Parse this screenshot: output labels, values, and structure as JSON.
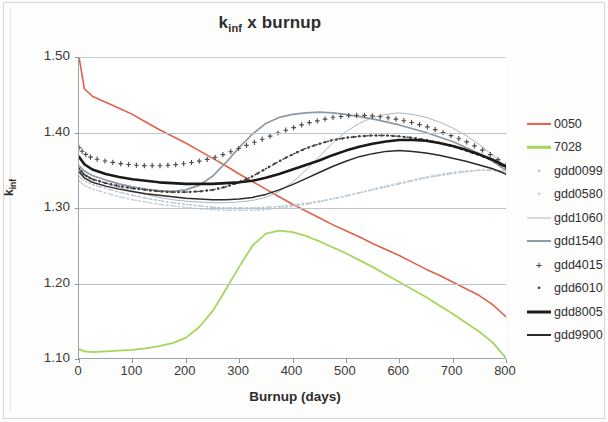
{
  "chart_data": {
    "type": "line",
    "title_main": "k",
    "title_sub": "inf",
    "title_rest": " x burnup",
    "xlabel": "Burnup (days)",
    "ylabel": "k_inf",
    "ylabel_main": "k",
    "ylabel_sub": "inf",
    "xlim": [
      0,
      800
    ],
    "ylim": [
      1.1,
      1.5
    ],
    "xticks": [
      0,
      100,
      200,
      300,
      400,
      500,
      600,
      700,
      800
    ],
    "yticks": [
      "1.10",
      "1.20",
      "1.30",
      "1.40",
      "1.50"
    ],
    "grid": "horizontal",
    "legend_position": "right",
    "x": [
      0,
      10,
      25,
      50,
      75,
      100,
      125,
      150,
      175,
      200,
      225,
      250,
      275,
      300,
      325,
      350,
      375,
      400,
      425,
      450,
      475,
      500,
      525,
      550,
      575,
      600,
      625,
      650,
      675,
      700,
      725,
      750,
      775,
      800
    ],
    "series": [
      {
        "name": "0050",
        "color": "#e0614a",
        "style": "solid",
        "width": 1.6,
        "marker": "none",
        "values": [
          1.5,
          1.458,
          1.448,
          1.44,
          1.432,
          1.424,
          1.414,
          1.404,
          1.395,
          1.386,
          1.376,
          1.366,
          1.356,
          1.345,
          1.335,
          1.325,
          1.315,
          1.305,
          1.296,
          1.287,
          1.278,
          1.27,
          1.262,
          1.253,
          1.245,
          1.237,
          1.228,
          1.219,
          1.211,
          1.202,
          1.193,
          1.184,
          1.172,
          1.156
        ]
      },
      {
        "name": "7028",
        "color": "#a5d65c",
        "style": "solid",
        "width": 1.8,
        "marker": "none",
        "values": [
          1.113,
          1.11,
          1.109,
          1.11,
          1.111,
          1.112,
          1.114,
          1.117,
          1.121,
          1.128,
          1.142,
          1.163,
          1.192,
          1.222,
          1.25,
          1.266,
          1.27,
          1.268,
          1.263,
          1.256,
          1.248,
          1.24,
          1.231,
          1.222,
          1.212,
          1.202,
          1.192,
          1.182,
          1.171,
          1.16,
          1.148,
          1.136,
          1.122,
          1.101
        ]
      },
      {
        "name": "gdd0099",
        "color": "#b8c4ce",
        "style": "dotted",
        "width": 1.3,
        "marker": "tiny-dot",
        "values": [
          1.342,
          1.336,
          1.331,
          1.326,
          1.321,
          1.317,
          1.313,
          1.31,
          1.307,
          1.305,
          1.303,
          1.301,
          1.3,
          1.3,
          1.3,
          1.301,
          1.302,
          1.304,
          1.306,
          1.309,
          1.312,
          1.316,
          1.32,
          1.324,
          1.328,
          1.332,
          1.336,
          1.34,
          1.343,
          1.346,
          1.348,
          1.35,
          1.35,
          1.349
        ]
      },
      {
        "name": "gdd0580",
        "color": "#c2ccd5",
        "style": "dotted",
        "width": 1.3,
        "marker": "tiny-dot",
        "values": [
          1.336,
          1.33,
          1.325,
          1.32,
          1.315,
          1.311,
          1.308,
          1.305,
          1.303,
          1.301,
          1.299,
          1.298,
          1.297,
          1.297,
          1.297,
          1.298,
          1.3,
          1.302,
          1.305,
          1.308,
          1.312,
          1.316,
          1.32,
          1.325,
          1.329,
          1.333,
          1.337,
          1.341,
          1.344,
          1.347,
          1.349,
          1.35,
          1.35,
          1.348
        ]
      },
      {
        "name": "gdd1060",
        "color": "#aab6c1",
        "style": "solid",
        "width": 1.0,
        "marker": "none",
        "values": [
          1.352,
          1.345,
          1.339,
          1.333,
          1.327,
          1.322,
          1.318,
          1.314,
          1.311,
          1.309,
          1.308,
          1.307,
          1.307,
          1.308,
          1.31,
          1.314,
          1.322,
          1.334,
          1.35,
          1.368,
          1.386,
          1.401,
          1.412,
          1.42,
          1.424,
          1.426,
          1.424,
          1.42,
          1.414,
          1.406,
          1.396,
          1.384,
          1.37,
          1.355
        ]
      },
      {
        "name": "gdd1540",
        "color": "#8e99a4",
        "style": "solid",
        "width": 1.7,
        "marker": "none",
        "values": [
          1.356,
          1.349,
          1.343,
          1.337,
          1.332,
          1.328,
          1.325,
          1.323,
          1.322,
          1.324,
          1.33,
          1.342,
          1.36,
          1.38,
          1.398,
          1.412,
          1.42,
          1.424,
          1.426,
          1.427,
          1.426,
          1.424,
          1.421,
          1.418,
          1.414,
          1.41,
          1.405,
          1.4,
          1.394,
          1.388,
          1.38,
          1.372,
          1.362,
          1.35
        ]
      },
      {
        "name": "gdd4015",
        "color": "#4a4a4a",
        "style": "none",
        "width": 0,
        "marker": "plus",
        "values": [
          1.38,
          1.372,
          1.366,
          1.362,
          1.359,
          1.357,
          1.356,
          1.356,
          1.357,
          1.359,
          1.362,
          1.366,
          1.372,
          1.379,
          1.386,
          1.393,
          1.4,
          1.406,
          1.412,
          1.416,
          1.42,
          1.422,
          1.423,
          1.422,
          1.42,
          1.417,
          1.413,
          1.408,
          1.402,
          1.395,
          1.388,
          1.379,
          1.369,
          1.357
        ]
      },
      {
        "name": "gdd6010",
        "color": "#3f3f3f",
        "style": "dotted",
        "width": 1.4,
        "marker": "dot",
        "values": [
          1.352,
          1.344,
          1.338,
          1.333,
          1.329,
          1.326,
          1.324,
          1.322,
          1.321,
          1.321,
          1.322,
          1.324,
          1.328,
          1.334,
          1.342,
          1.352,
          1.362,
          1.371,
          1.379,
          1.385,
          1.39,
          1.393,
          1.395,
          1.396,
          1.396,
          1.395,
          1.393,
          1.39,
          1.386,
          1.382,
          1.376,
          1.37,
          1.363,
          1.353
        ]
      },
      {
        "name": "gdd8005",
        "color": "#1a1a1a",
        "style": "solid",
        "width": 2.6,
        "marker": "none",
        "values": [
          1.368,
          1.358,
          1.351,
          1.345,
          1.341,
          1.338,
          1.336,
          1.334,
          1.333,
          1.332,
          1.332,
          1.332,
          1.333,
          1.334,
          1.336,
          1.34,
          1.345,
          1.351,
          1.357,
          1.363,
          1.37,
          1.376,
          1.381,
          1.385,
          1.388,
          1.39,
          1.39,
          1.389,
          1.386,
          1.382,
          1.377,
          1.371,
          1.364,
          1.355
        ]
      },
      {
        "name": "gdd9900",
        "color": "#2b2b2b",
        "style": "solid",
        "width": 1.5,
        "marker": "none",
        "values": [
          1.348,
          1.34,
          1.334,
          1.329,
          1.325,
          1.322,
          1.319,
          1.317,
          1.315,
          1.313,
          1.312,
          1.311,
          1.311,
          1.312,
          1.314,
          1.318,
          1.324,
          1.331,
          1.339,
          1.347,
          1.355,
          1.362,
          1.368,
          1.372,
          1.375,
          1.376,
          1.375,
          1.373,
          1.37,
          1.366,
          1.362,
          1.357,
          1.352,
          1.345
        ]
      }
    ]
  },
  "legend": {
    "items": [
      {
        "label": "0050",
        "key": "line",
        "color": "#e0614a",
        "width": 2.2,
        "dash": "none"
      },
      {
        "label": "7028",
        "key": "line",
        "color": "#a5d65c",
        "width": 2.4,
        "dash": "none"
      },
      {
        "label": "gdd0099",
        "key": "dot",
        "color": "#b8c4ce",
        "width": 1.2,
        "dash": "dot"
      },
      {
        "label": "gdd0580",
        "key": "dot",
        "color": "#c2ccd5",
        "width": 1.2,
        "dash": "dot"
      },
      {
        "label": "gdd1060",
        "key": "line",
        "color": "#aab6c1",
        "width": 1.0,
        "dash": "none"
      },
      {
        "label": "gdd1540",
        "key": "line",
        "color": "#8e99a4",
        "width": 2.0,
        "dash": "none"
      },
      {
        "label": "gdd4015",
        "key": "plus",
        "color": "#3a3a3a",
        "width": 0,
        "dash": "none"
      },
      {
        "label": "gdd6010",
        "key": "dot",
        "color": "#3a3a3a",
        "width": 0,
        "dash": "none"
      },
      {
        "label": "gdd8005",
        "key": "line",
        "color": "#1a1a1a",
        "width": 3.0,
        "dash": "none"
      },
      {
        "label": "gdd9900",
        "key": "line",
        "color": "#2b2b2b",
        "width": 2.0,
        "dash": "none"
      }
    ]
  },
  "colors": {
    "grid": "#b9c4cd",
    "axis": "#9aa4ad",
    "text": "#2d2d2d",
    "background": "#ffffff"
  }
}
